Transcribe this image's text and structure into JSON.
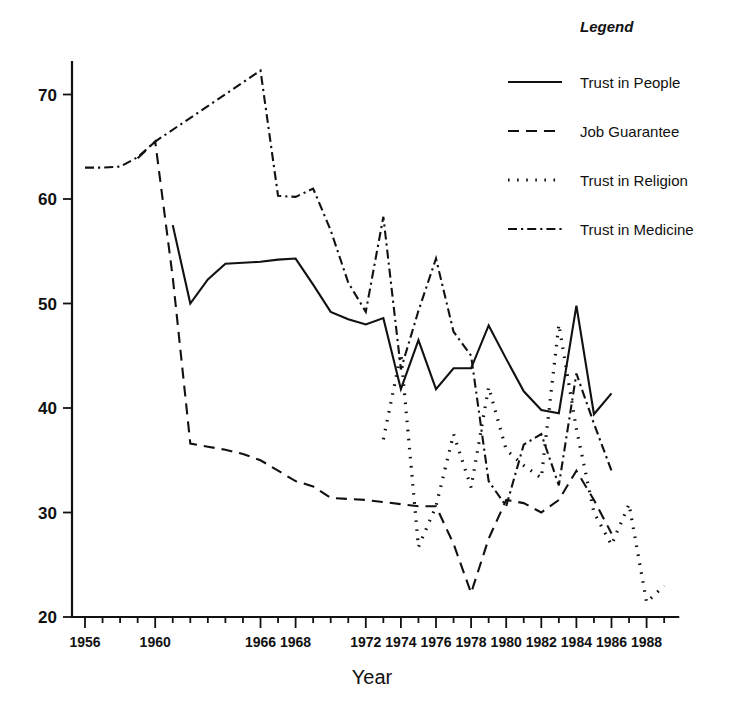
{
  "chart_data": {
    "type": "line",
    "title": "",
    "xlabel": "Year",
    "ylabel": "",
    "xlim": [
      1955,
      1990
    ],
    "ylim": [
      20,
      75
    ],
    "grid": false,
    "legend_position": "top-right",
    "legend_title": "Legend",
    "y_ticks": [
      20,
      30,
      40,
      50,
      60,
      70
    ],
    "x_ticks": [
      1956,
      1957,
      1958,
      1959,
      1960,
      1961,
      1962,
      1963,
      1964,
      1965,
      1966,
      1967,
      1968,
      1969,
      1970,
      1971,
      1972,
      1973,
      1974,
      1975,
      1976,
      1977,
      1978,
      1979,
      1980,
      1981,
      1982,
      1983,
      1984,
      1985,
      1986,
      1987,
      1988,
      1989
    ],
    "x_tick_labels": [
      "1956",
      "1960",
      "1966",
      "1968",
      "1972",
      "1974",
      "1976",
      "1978",
      "1980",
      "1982",
      "1984",
      "1986",
      "1988"
    ],
    "x_tick_label_years": [
      1956,
      1960,
      1966,
      1968,
      1972,
      1974,
      1976,
      1978,
      1980,
      1982,
      1984,
      1986,
      1988
    ],
    "series": [
      {
        "name": "Trust in People",
        "style": "solid",
        "x": [
          1961,
          1962,
          1963,
          1964,
          1965,
          1966,
          1967,
          1968,
          1969,
          1970,
          1971,
          1972,
          1973,
          1974,
          1975,
          1976,
          1977,
          1978,
          1979,
          1980,
          1981,
          1982,
          1983,
          1984,
          1985,
          1986
        ],
        "values": [
          57.5,
          50.0,
          52.3,
          53.8,
          53.9,
          54.0,
          54.2,
          54.3,
          51.8,
          49.2,
          48.5,
          48.0,
          48.6,
          41.8,
          46.5,
          41.8,
          43.8,
          43.8,
          47.9,
          44.7,
          41.6,
          39.8,
          39.5,
          49.8,
          39.4,
          41.4
        ]
      },
      {
        "name": "Job Guarantee",
        "style": "dashed",
        "x": [
          1959,
          1960,
          1961,
          1962,
          1963,
          1964,
          1965,
          1966,
          1967,
          1968,
          1969,
          1970,
          1971,
          1972,
          1973,
          1974,
          1975,
          1976,
          1977,
          1978,
          1979,
          1980,
          1981,
          1982,
          1983,
          1984,
          1985,
          1986
        ],
        "values": [
          63.9,
          65.5,
          52.5,
          36.6,
          36.3,
          36.0,
          35.6,
          35.0,
          34.0,
          33.0,
          32.5,
          31.4,
          31.3,
          31.2,
          31.0,
          30.8,
          30.6,
          30.6,
          27.0,
          22.3,
          27.5,
          31.2,
          30.9,
          30.0,
          31.2,
          34.0,
          31.2,
          28.0
        ]
      },
      {
        "name": "Trust in Religion",
        "style": "dotted",
        "x": [
          1973,
          1974,
          1975,
          1976,
          1977,
          1978,
          1979,
          1980,
          1981,
          1982,
          1983,
          1984,
          1985,
          1986,
          1987,
          1988,
          1989
        ],
        "values": [
          37.0,
          45.2,
          26.7,
          30.6,
          37.5,
          32.4,
          42.0,
          36.0,
          34.5,
          33.3,
          48.0,
          38.0,
          30.0,
          26.9,
          30.8,
          21.4,
          23.0
        ]
      },
      {
        "name": "Trust in Medicine",
        "style": "dashdot",
        "x": [
          1956,
          1957,
          1958,
          1959,
          1960,
          1966,
          1967,
          1968,
          1969,
          1970,
          1971,
          1972,
          1973,
          1974,
          1975,
          1976,
          1977,
          1978,
          1979,
          1980,
          1981,
          1982,
          1983,
          1984,
          1985,
          1986
        ],
        "values": [
          63.0,
          63.0,
          63.1,
          64.0,
          65.5,
          72.3,
          60.3,
          60.2,
          61.0,
          57.0,
          52.0,
          49.2,
          58.3,
          43.7,
          49.3,
          54.3,
          47.3,
          45.0,
          33.0,
          30.6,
          36.5,
          37.5,
          32.6,
          43.3,
          38.5,
          34.0
        ]
      }
    ]
  },
  "legend": {
    "title": "Legend",
    "entries": [
      {
        "label": "Trust in People",
        "style": "solid"
      },
      {
        "label": "Job Guarantee",
        "style": "dashed"
      },
      {
        "label": "Trust in Religion",
        "style": "dotted"
      },
      {
        "label": "Trust in Medicine",
        "style": "dashdot"
      }
    ]
  },
  "axes": {
    "x_title": "Year"
  }
}
